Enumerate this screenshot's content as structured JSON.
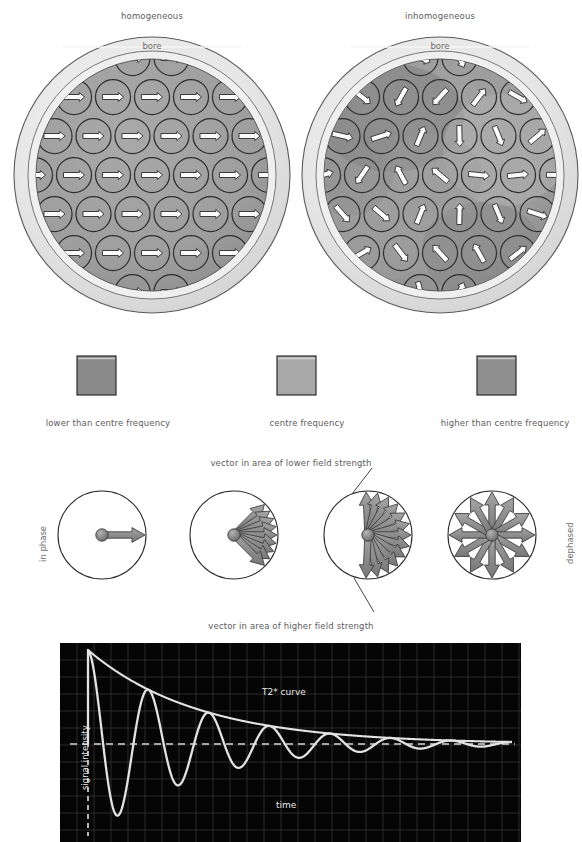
{
  "magnets": [
    {
      "id": "homogeneous",
      "label": "homogeneous",
      "bore_label": "bore",
      "cx": 152,
      "cy": 175
    },
    {
      "id": "inhomogeneous",
      "label": "inhomogeneous",
      "bore_label": "bore",
      "cx": 440,
      "cy": 175
    }
  ],
  "frequency_legend": {
    "items": [
      {
        "label": "lower than centre frequency",
        "color": "#8a8a8a",
        "box_x": 77,
        "box_y": 356,
        "text_x": 108
      },
      {
        "label": "centre frequency",
        "color": "#a8a8a8",
        "box_x": 277,
        "box_y": 356,
        "text_x": 307
      },
      {
        "label": "higher than centre frequency",
        "color": "#8f8f8f",
        "box_x": 477,
        "box_y": 356,
        "text_x": 505
      }
    ],
    "box_size": 39
  },
  "phase_diagram": {
    "left_label": "in phase",
    "right_label": "dephased",
    "annotation_top": "vector in area of lower field strength",
    "annotation_bottom": "vector in area of higher field strength",
    "circles": [
      {
        "id": "in-phase",
        "cx": 102,
        "cy": 535,
        "r": 44,
        "vectors": 1,
        "spread_deg": 0
      },
      {
        "id": "slight-dephase",
        "cx": 234,
        "cy": 535,
        "r": 44,
        "vectors": 9,
        "spread_deg": 90
      },
      {
        "id": "more-dephase",
        "cx": 368,
        "cy": 535,
        "r": 44,
        "vectors": 13,
        "spread_deg": 185
      },
      {
        "id": "fully-dephased",
        "cx": 492,
        "cy": 535,
        "r": 44,
        "vectors": 12,
        "spread_deg": 360
      }
    ],
    "vector_fill": "#8d8d8d",
    "vector_stroke": "#3a3a3a"
  },
  "chart_data": {
    "type": "line",
    "title": "",
    "xlabel": "time",
    "ylabel": "signal intensity",
    "series": [
      {
        "name": "T2* curve",
        "role": "envelope",
        "description": "monoexponential decay envelope from peak amplitude to baseline",
        "x": [
          0,
          0.5,
          1,
          1.5,
          2,
          2.5,
          3,
          3.5,
          4,
          4.5,
          5,
          5.5,
          6,
          6.5,
          7,
          7.5,
          8
        ],
        "y": [
          1.0,
          0.88,
          0.78,
          0.69,
          0.61,
          0.54,
          0.48,
          0.42,
          0.37,
          0.33,
          0.29,
          0.26,
          0.23,
          0.2,
          0.18,
          0.16,
          0.14
        ]
      },
      {
        "name": "FID signal",
        "role": "oscillation",
        "description": "damped sinusoid oscillating about the baseline, 7 visible cycles",
        "cycles": 7,
        "amplitude_start": 1.0,
        "amplitude_end": 0.08,
        "decay_constant": 0.26
      }
    ],
    "annotations": [
      {
        "text": "T2* curve",
        "x": 290,
        "y": 692
      },
      {
        "text": "time",
        "x": 290,
        "y": 805
      },
      {
        "text": "signal intensity",
        "x": 86,
        "y": 775
      }
    ],
    "baseline_style": "dashed",
    "axis_style": "dashed",
    "grid": true,
    "grid_spacing_px": 17,
    "background": "#050505",
    "curve_color": "#e2e2e2",
    "grid_color": "#3b3b3b",
    "plot_box": {
      "x": 60,
      "y": 643,
      "width": 461,
      "height": 199
    }
  }
}
